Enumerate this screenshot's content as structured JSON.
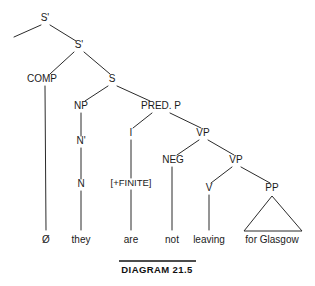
{
  "figure": {
    "type": "syntax-tree",
    "caption": "DIAGRAM 21.5",
    "sentence": "they are not leaving for Glasgow"
  },
  "nodes": {
    "s_bar_top": {
      "label": "S'",
      "x": 45,
      "y": 21
    },
    "s_bar_inner": {
      "label": "S'",
      "x": 79,
      "y": 48
    },
    "comp": {
      "label": "COMP",
      "x": 42,
      "y": 82
    },
    "s": {
      "label": "S",
      "x": 112,
      "y": 82
    },
    "np": {
      "label": "NP",
      "x": 81,
      "y": 109
    },
    "n_bar": {
      "label": "N'",
      "x": 81,
      "y": 144
    },
    "n": {
      "label": "N",
      "x": 81,
      "y": 187
    },
    "pred_p": {
      "label": "PRED. P",
      "x": 161,
      "y": 109
    },
    "i": {
      "label": "I",
      "x": 131,
      "y": 136
    },
    "finite": {
      "label": "[+FINITE]",
      "x": 131,
      "y": 186
    },
    "vp_upper": {
      "label": "VP",
      "x": 203,
      "y": 136
    },
    "neg": {
      "label": "NEG",
      "x": 173,
      "y": 163
    },
    "vp_lower": {
      "label": "VP",
      "x": 236,
      "y": 163
    },
    "v": {
      "label": "V",
      "x": 209,
      "y": 191
    },
    "pp": {
      "label": "PP",
      "x": 272,
      "y": 191
    }
  },
  "terminals": [
    {
      "label": "Ø",
      "x": 46,
      "y": 243
    },
    {
      "label": "they",
      "x": 81,
      "y": 243
    },
    {
      "label": "are",
      "x": 131,
      "y": 243
    },
    {
      "label": "not",
      "x": 172,
      "y": 243
    },
    {
      "label": "leaving",
      "x": 209,
      "y": 243
    },
    {
      "label": "for  Glasgow",
      "x": 272,
      "y": 243
    }
  ],
  "caption": {
    "text": "DIAGRAM 21.5",
    "x": 157,
    "y": 273,
    "rule_x1": 119,
    "rule_x2": 196,
    "rule_y": 261
  },
  "colors": {
    "ink": "#1a1a1a",
    "line": "#2b2b2b",
    "background": "#ffffff"
  }
}
